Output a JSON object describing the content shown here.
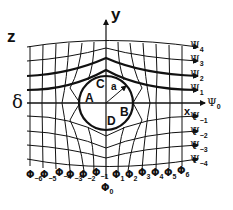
{
  "diagram": {
    "title_label": "z",
    "axes": {
      "y_label": "y",
      "x_label": "x"
    },
    "left_marker": "δ",
    "circle": {
      "radius_label": "a",
      "points": [
        "A",
        "B",
        "C",
        "D"
      ]
    },
    "streamlines": [
      {
        "sym": "Ψ",
        "sub": "4"
      },
      {
        "sym": "Ψ",
        "sub": "3"
      },
      {
        "sym": "Ψ",
        "sub": "2"
      },
      {
        "sym": "Ψ",
        "sub": "1"
      },
      {
        "sym": "Ψ",
        "sub": "0"
      },
      {
        "sym": "Ψ",
        "sub": "−1"
      },
      {
        "sym": "Ψ",
        "sub": "−2"
      },
      {
        "sym": "Ψ",
        "sub": "−3"
      },
      {
        "sym": "Ψ",
        "sub": "−4"
      }
    ],
    "potentials": [
      {
        "sym": "Φ",
        "sub": "−6"
      },
      {
        "sym": "Φ",
        "sub": "−5"
      },
      {
        "sym": "Φ",
        "sub": "−4"
      },
      {
        "sym": "Φ",
        "sub": "−3"
      },
      {
        "sym": "Φ",
        "sub": "−2"
      },
      {
        "sym": "Φ",
        "sub": "−1"
      },
      {
        "sym": "Φ",
        "sub": "0"
      },
      {
        "sym": "Φ",
        "sub": "1"
      },
      {
        "sym": "Φ",
        "sub": "2"
      },
      {
        "sym": "Φ",
        "sub": "3"
      },
      {
        "sym": "Φ",
        "sub": "4"
      },
      {
        "sym": "Φ",
        "sub": "5"
      },
      {
        "sym": "Φ",
        "sub": "6"
      }
    ],
    "colors": {
      "ink": "#111111",
      "background": "#ffffff"
    }
  }
}
